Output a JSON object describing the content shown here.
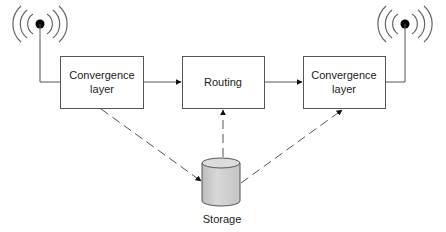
{
  "diagram": {
    "nodes": {
      "left_convergence": {
        "line1": "Convergence",
        "line2": "layer"
      },
      "routing": {
        "label": "Routing"
      },
      "right_convergence": {
        "line1": "Convergence",
        "line2": "layer"
      },
      "storage": {
        "label": "Storage"
      }
    },
    "edges": [
      {
        "from": "left_convergence",
        "to": "routing",
        "style": "solid",
        "arrow": "end"
      },
      {
        "from": "routing",
        "to": "right_convergence",
        "style": "solid",
        "arrow": "end"
      },
      {
        "from": "left_convergence",
        "to": "storage",
        "style": "dashed",
        "arrow": "end"
      },
      {
        "from": "storage",
        "to": "routing",
        "style": "dashed",
        "arrow": "end"
      },
      {
        "from": "storage",
        "to": "right_convergence",
        "style": "dashed",
        "arrow": "end"
      },
      {
        "from": "left_antenna",
        "to": "left_convergence",
        "style": "solid",
        "arrow": "none"
      },
      {
        "from": "right_antenna",
        "to": "right_convergence",
        "style": "solid",
        "arrow": "none"
      }
    ],
    "icons": {
      "left_antenna": "wireless-antenna-icon",
      "right_antenna": "wireless-antenna-icon",
      "storage": "database-cylinder-icon"
    },
    "colors": {
      "stroke": "#555555",
      "text": "#222222",
      "cylinder_fill": "#cfcfcf",
      "background": "#ffffff"
    }
  }
}
